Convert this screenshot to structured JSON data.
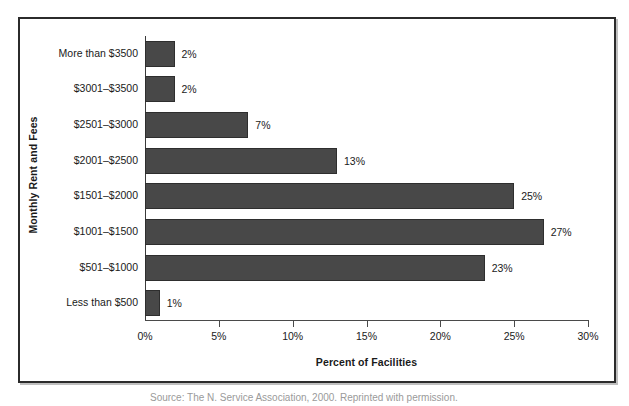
{
  "chart_data": {
    "type": "bar",
    "orientation": "horizontal",
    "title": "",
    "xlabel": "Percent of Facilities",
    "ylabel": "Monthly Rent and Fees",
    "categories": [
      "More than $3500",
      "$3001–$3500",
      "$2501–$3000",
      "$2001–$2500",
      "$1501–$2000",
      "$1001–$1500",
      "$501–$1000",
      "Less than $500"
    ],
    "values": [
      2,
      2,
      7,
      13,
      25,
      27,
      23,
      1
    ],
    "value_labels": [
      "2%",
      "2%",
      "7%",
      "13%",
      "25%",
      "27%",
      "23%",
      "1%"
    ],
    "xlim": [
      0,
      30
    ],
    "xticks": [
      0,
      5,
      10,
      15,
      20,
      25,
      30
    ],
    "xtick_labels": [
      "0%",
      "5%",
      "10%",
      "15%",
      "20%",
      "25%",
      "30%"
    ],
    "grid": false,
    "legend": "none",
    "bar_color": "#484848",
    "bar_edge_color": "#2e2e2e",
    "axis_color": "#4a4a4a",
    "text_color": "#1a1a1a",
    "background_color": "#ffffff"
  },
  "caption": {
    "cut_off_text": "partially cropped caption line"
  }
}
